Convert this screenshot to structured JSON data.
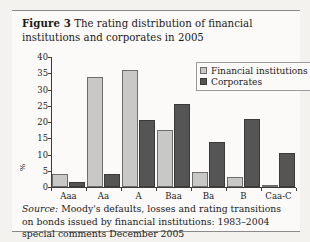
{
  "figure": {
    "label": "Figure 3",
    "caption": "The rating distribution of financial institutions and corporates in 2005"
  },
  "source": {
    "keyword": "Source:",
    "text": "Moody's defaults, losses and rating transitions on bonds issued by financial institutions: 1983–2004 special comments December 2005"
  },
  "legend": {
    "entries": [
      {
        "label": "Financial institutions",
        "color": "#c8c8c6",
        "key": "fin"
      },
      {
        "label": "Corporates",
        "color": "#555555",
        "key": "corp"
      }
    ]
  },
  "chart_data": {
    "type": "bar",
    "title": "The rating distribution of financial institutions and corporates in 2005",
    "xlabel": "",
    "ylabel": "%",
    "ylim": [
      0,
      40
    ],
    "yticks": [
      0,
      5,
      10,
      15,
      20,
      25,
      30,
      35,
      40
    ],
    "ytick_labels": [
      "0",
      "5",
      "10",
      "15",
      "20",
      "25",
      "30",
      "35",
      "40"
    ],
    "grid": false,
    "legend_position": "top-right",
    "categories": [
      "Aaa",
      "Aa",
      "A",
      "Baa",
      "Ba",
      "B",
      "Caa-C"
    ],
    "series": [
      {
        "name": "Financial institutions",
        "color": "#c8c8c6",
        "values": [
          4,
          34,
          36,
          17.5,
          4.5,
          3,
          0.3
        ]
      },
      {
        "name": "Corporates",
        "color": "#555555",
        "values": [
          1.5,
          4,
          20.5,
          25.5,
          14,
          21,
          10.5
        ]
      }
    ]
  }
}
